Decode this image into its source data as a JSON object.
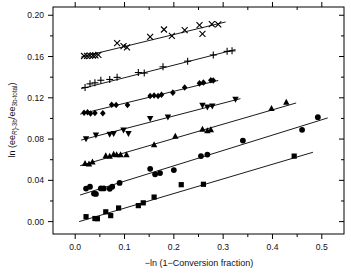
{
  "chart_data": {
    "type": "scatter",
    "title": "",
    "subtitle": "",
    "xlabel": "−ln (1−Conversion fraction)",
    "ylabel_parts": {
      "prefix": "ln (ee",
      "sub1_italic": "R",
      "sub1_rest": ")-3b",
      "mid": "/ee",
      "sub2": "3b-total",
      "suffix": ")"
    },
    "ylabel": "ln (ee(R)-3b/ee3b-total)",
    "xlim": [
      -0.045,
      0.545
    ],
    "ylim": [
      -0.012,
      0.208
    ],
    "xticks": [
      0.0,
      0.1,
      0.2,
      0.3,
      0.4,
      0.5
    ],
    "xticklabels": [
      "0.0",
      "0.1",
      "0.2",
      "0.3",
      "0.4",
      "0.5"
    ],
    "yticks": [
      0.0,
      0.04,
      0.08,
      0.12,
      0.16,
      0.2
    ],
    "yticklabels": [
      "0.00",
      "0.04",
      "0.08",
      "0.12",
      "0.16",
      "0.20"
    ],
    "xminor": [
      0.05,
      0.15,
      0.25,
      0.35,
      0.45
    ],
    "yminor": [
      0.02,
      0.06,
      0.1,
      0.14,
      0.18
    ],
    "grid": false,
    "legend": "none",
    "tick_direction": "out",
    "frame": "box",
    "marker_color": "#000000",
    "line_color": "#000000",
    "series": [
      {
        "name": "series-x-cross",
        "marker": "x",
        "fit_line": {
          "x0": 0.012,
          "y0": 0.1595,
          "x1": 0.305,
          "y1": 0.1935
        },
        "points": [
          {
            "x": 0.018,
            "y": 0.1605
          },
          {
            "x": 0.024,
            "y": 0.1607
          },
          {
            "x": 0.03,
            "y": 0.1608
          },
          {
            "x": 0.036,
            "y": 0.161
          },
          {
            "x": 0.041,
            "y": 0.1612
          },
          {
            "x": 0.047,
            "y": 0.1615
          },
          {
            "x": 0.085,
            "y": 0.173
          },
          {
            "x": 0.098,
            "y": 0.17
          },
          {
            "x": 0.105,
            "y": 0.1688
          },
          {
            "x": 0.152,
            "y": 0.179
          },
          {
            "x": 0.18,
            "y": 0.1862
          },
          {
            "x": 0.196,
            "y": 0.18
          },
          {
            "x": 0.222,
            "y": 0.1855
          },
          {
            "x": 0.252,
            "y": 0.1905
          },
          {
            "x": 0.258,
            "y": 0.182
          },
          {
            "x": 0.277,
            "y": 0.1915
          },
          {
            "x": 0.29,
            "y": 0.1912
          }
        ]
      },
      {
        "name": "series-plus",
        "marker": "plus",
        "fit_line": {
          "x0": 0.012,
          "y0": 0.1288,
          "x1": 0.325,
          "y1": 0.1668
        },
        "points": [
          {
            "x": 0.02,
            "y": 0.13
          },
          {
            "x": 0.03,
            "y": 0.1335
          },
          {
            "x": 0.04,
            "y": 0.1345
          },
          {
            "x": 0.052,
            "y": 0.137
          },
          {
            "x": 0.07,
            "y": 0.1378
          },
          {
            "x": 0.085,
            "y": 0.1398
          },
          {
            "x": 0.128,
            "y": 0.1445
          },
          {
            "x": 0.14,
            "y": 0.144
          },
          {
            "x": 0.178,
            "y": 0.15
          },
          {
            "x": 0.228,
            "y": 0.1555
          },
          {
            "x": 0.28,
            "y": 0.1615
          },
          {
            "x": 0.308,
            "y": 0.165
          },
          {
            "x": 0.318,
            "y": 0.1655
          }
        ]
      },
      {
        "name": "series-diamond",
        "marker": "diamond",
        "fit_line": {
          "x0": 0.01,
          "y0": 0.1042,
          "x1": 0.29,
          "y1": 0.1368
        },
        "points": [
          {
            "x": 0.018,
            "y": 0.1055
          },
          {
            "x": 0.025,
            "y": 0.106
          },
          {
            "x": 0.031,
            "y": 0.1048
          },
          {
            "x": 0.04,
            "y": 0.1052
          },
          {
            "x": 0.056,
            "y": 0.105
          },
          {
            "x": 0.074,
            "y": 0.1132
          },
          {
            "x": 0.083,
            "y": 0.113
          },
          {
            "x": 0.106,
            "y": 0.113
          },
          {
            "x": 0.152,
            "y": 0.1218
          },
          {
            "x": 0.16,
            "y": 0.1222
          },
          {
            "x": 0.168,
            "y": 0.1218
          },
          {
            "x": 0.175,
            "y": 0.123
          },
          {
            "x": 0.198,
            "y": 0.125
          },
          {
            "x": 0.222,
            "y": 0.13
          },
          {
            "x": 0.252,
            "y": 0.134
          },
          {
            "x": 0.26,
            "y": 0.1348
          },
          {
            "x": 0.275,
            "y": 0.137
          },
          {
            "x": 0.28,
            "y": 0.1368
          }
        ]
      },
      {
        "name": "series-down-triangle",
        "marker": "triangle-down",
        "fit_line": {
          "x0": 0.012,
          "y0": 0.079,
          "x1": 0.335,
          "y1": 0.1192
        },
        "points": [
          {
            "x": 0.022,
            "y": 0.0802
          },
          {
            "x": 0.042,
            "y": 0.0838
          },
          {
            "x": 0.07,
            "y": 0.0845
          },
          {
            "x": 0.078,
            "y": 0.0852
          },
          {
            "x": 0.098,
            "y": 0.0888
          },
          {
            "x": 0.108,
            "y": 0.0852
          },
          {
            "x": 0.152,
            "y": 0.0998
          },
          {
            "x": 0.188,
            "y": 0.1012
          },
          {
            "x": 0.258,
            "y": 0.1128
          },
          {
            "x": 0.268,
            "y": 0.111
          },
          {
            "x": 0.278,
            "y": 0.112
          },
          {
            "x": 0.325,
            "y": 0.1185
          }
        ]
      },
      {
        "name": "series-up-triangle",
        "marker": "triangle-up",
        "fit_line": {
          "x0": 0.01,
          "y0": 0.0542,
          "x1": 0.448,
          "y1": 0.115
        },
        "points": [
          {
            "x": 0.02,
            "y": 0.0565
          },
          {
            "x": 0.028,
            "y": 0.056
          },
          {
            "x": 0.035,
            "y": 0.0578
          },
          {
            "x": 0.062,
            "y": 0.064
          },
          {
            "x": 0.07,
            "y": 0.0635
          },
          {
            "x": 0.078,
            "y": 0.0655
          },
          {
            "x": 0.084,
            "y": 0.065
          },
          {
            "x": 0.092,
            "y": 0.0648
          },
          {
            "x": 0.104,
            "y": 0.0648
          },
          {
            "x": 0.16,
            "y": 0.0745
          },
          {
            "x": 0.203,
            "y": 0.0828
          },
          {
            "x": 0.258,
            "y": 0.0895
          },
          {
            "x": 0.268,
            "y": 0.0882
          },
          {
            "x": 0.275,
            "y": 0.0892
          },
          {
            "x": 0.398,
            "y": 0.1098
          },
          {
            "x": 0.428,
            "y": 0.1158
          }
        ]
      },
      {
        "name": "series-circle",
        "marker": "circle",
        "fit_line": {
          "x0": 0.01,
          "y0": 0.0258,
          "x1": 0.512,
          "y1": 0.1005
        },
        "points": [
          {
            "x": 0.022,
            "y": 0.032
          },
          {
            "x": 0.03,
            "y": 0.0338
          },
          {
            "x": 0.038,
            "y": 0.0272
          },
          {
            "x": 0.042,
            "y": 0.0268
          },
          {
            "x": 0.052,
            "y": 0.0322
          },
          {
            "x": 0.058,
            "y": 0.0322
          },
          {
            "x": 0.07,
            "y": 0.0318
          },
          {
            "x": 0.075,
            "y": 0.0338
          },
          {
            "x": 0.09,
            "y": 0.0375
          },
          {
            "x": 0.152,
            "y": 0.0512
          },
          {
            "x": 0.162,
            "y": 0.0458
          },
          {
            "x": 0.172,
            "y": 0.047
          },
          {
            "x": 0.2,
            "y": 0.05
          },
          {
            "x": 0.255,
            "y": 0.0635
          },
          {
            "x": 0.268,
            "y": 0.065
          },
          {
            "x": 0.34,
            "y": 0.0785
          },
          {
            "x": 0.46,
            "y": 0.089
          },
          {
            "x": 0.492,
            "y": 0.1012
          }
        ]
      },
      {
        "name": "series-square",
        "marker": "square",
        "fit_line": {
          "x0": 0.008,
          "y0": 0.0,
          "x1": 0.482,
          "y1": 0.0672
        },
        "points": [
          {
            "x": 0.022,
            "y": 0.0048
          },
          {
            "x": 0.04,
            "y": 0.003
          },
          {
            "x": 0.045,
            "y": 0.0028
          },
          {
            "x": 0.062,
            "y": 0.0095
          },
          {
            "x": 0.072,
            "y": 0.0058
          },
          {
            "x": 0.088,
            "y": 0.0132
          },
          {
            "x": 0.128,
            "y": 0.0155
          },
          {
            "x": 0.138,
            "y": 0.0182
          },
          {
            "x": 0.16,
            "y": 0.0238
          },
          {
            "x": 0.215,
            "y": 0.0358
          },
          {
            "x": 0.26,
            "y": 0.0362
          },
          {
            "x": 0.444,
            "y": 0.0635
          }
        ]
      }
    ]
  }
}
